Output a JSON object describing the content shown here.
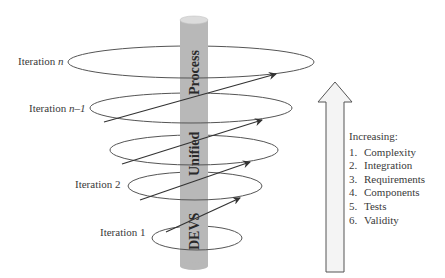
{
  "diagram": {
    "type": "spiral-iteration-diagram",
    "cylinder": {
      "label_top": "Process",
      "label_middle": "Unified",
      "label_bottom": "DEVS",
      "color": "#b8b8b8"
    },
    "iterations": [
      {
        "label_prefix": "Iteration",
        "label_suffix": "n"
      },
      {
        "label_prefix": "Iteration",
        "label_suffix": "n–1"
      },
      {
        "label_prefix": "",
        "label_suffix": ""
      },
      {
        "label_prefix": "Iteration",
        "label_suffix": "2"
      },
      {
        "label_prefix": "Iteration",
        "label_suffix": "1"
      }
    ],
    "legend": {
      "title": "Increasing:",
      "items": [
        {
          "num": "1.",
          "text": "Complexity"
        },
        {
          "num": "2.",
          "text": "Integration"
        },
        {
          "num": "3.",
          "text": "Requirements"
        },
        {
          "num": "4.",
          "text": "Components"
        },
        {
          "num": "5.",
          "text": "Tests"
        },
        {
          "num": "6.",
          "text": "Validity"
        }
      ]
    },
    "colors": {
      "line": "#444444",
      "cylinder": "#b8b8b8",
      "cylinder_top": "#dcdcdc",
      "arrow_fill": "#f4f4f4",
      "arrow_stroke": "#555555",
      "text": "#3a3a3a"
    }
  }
}
